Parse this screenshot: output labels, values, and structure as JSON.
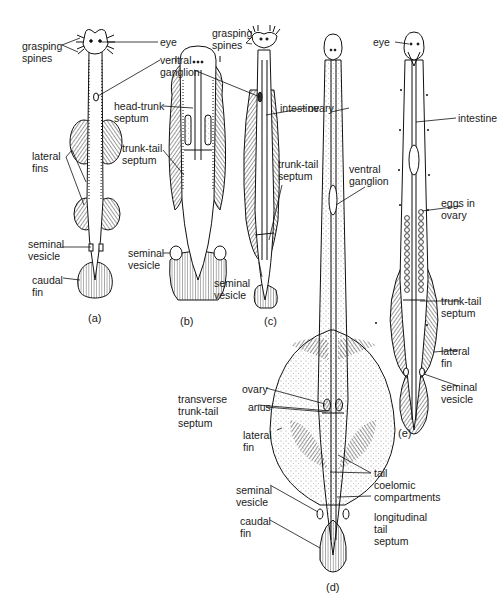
{
  "figure": {
    "panels": [
      {
        "id": "a",
        "caption": "(a)",
        "labels": {
          "grasping_spines": "grasping\nspines",
          "eye": "eye",
          "ventral_ganglion": "ventral\nganglion",
          "lateral_fins": "lateral\nfins",
          "seminal_vesicle": "seminal\nvesicle",
          "caudal_fin": "caudal\nfin"
        }
      },
      {
        "id": "b",
        "caption": "(b)",
        "labels": {
          "head_trunk_septum": "head-trunk\nseptum",
          "trunk_tail_septum": "trunk-tail\nseptum",
          "seminal_vesicle": "seminal\nvesicle"
        }
      },
      {
        "id": "c",
        "caption": "(c)",
        "labels": {
          "grasping_spines": "grasping\nspines",
          "intestine": "intestine",
          "trunk_tail_septum": "trunk-tail\nseptum",
          "seminal_vesicle": "seminal\nvesicle"
        }
      },
      {
        "id": "d",
        "caption": "(d)",
        "labels": {
          "ventral_ganglion": "ventral\nganglion",
          "ovary": "ovary",
          "anus": "anus",
          "transverse_trunk_tail_septum": "transverse\ntrunk-tail\nseptum",
          "lateral_fin": "lateral\nfin",
          "tail_coelomic_compartments": "tail\ncoelomic\ncompartments",
          "seminal_vesicle": "seminal\nvesicle",
          "longitudinal_tail_septum": "longitudinal\ntail\nseptum",
          "caudal_fin": "caudal\nfin"
        }
      },
      {
        "id": "e",
        "caption": "(e)",
        "labels": {
          "eye": "eye",
          "intestine": "intestine",
          "eggs_in_ovary": "eggs in\novary",
          "trunk_tail_septum": "trunk-tail\nseptum",
          "lateral_fin": "lateral\nfin",
          "seminal_vesicle": "seminal\nvesicle"
        }
      }
    ]
  }
}
